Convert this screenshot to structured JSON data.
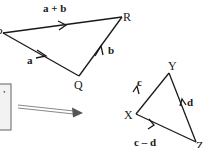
{
  "triangle_pqr": {
    "vertices": {
      "P": "P",
      "Q": "Q",
      "R": "R"
    },
    "edges": {
      "pr": "a + b",
      "pq": "a",
      "qr": "b"
    }
  },
  "triangle_xyz": {
    "vertices": {
      "X": "X",
      "Y": "Y",
      "Z": "Z"
    },
    "edges": {
      "xy": "c",
      "zy": "d",
      "xz": "c – d"
    }
  },
  "callout_box": {
    "glyph": "'"
  },
  "colors": {
    "line": "#1a1a1a",
    "box_fill": "#f2f2f2",
    "box_border": "#7a7a7a",
    "pointer_arrow": "#888888"
  }
}
